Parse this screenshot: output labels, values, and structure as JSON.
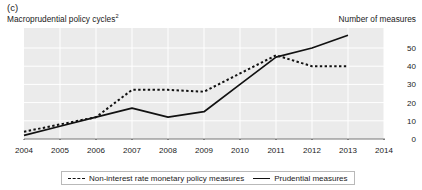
{
  "panel": {
    "letter": "(c)",
    "title": "Macroprudential policy cycles",
    "title_footnote": "2",
    "unit_label": "Number of measures"
  },
  "legend": {
    "position": "bottom-center",
    "items": [
      {
        "label": "Non-interest rate monetary policy measures",
        "style": "dashed",
        "color": "#111111"
      },
      {
        "label": "Prudential measures",
        "style": "solid",
        "color": "#111111"
      }
    ]
  },
  "axes": {
    "y_side": "right",
    "y_ticks": [
      "0",
      "10",
      "20",
      "30",
      "40",
      "50"
    ],
    "x_ticks": [
      "2004",
      "2005",
      "2006",
      "2007",
      "2008",
      "2009",
      "2010",
      "2011",
      "2012",
      "2013",
      "2014"
    ],
    "grid": true,
    "plot_background": "#ebebeb",
    "grid_color": "#ffffff"
  },
  "chart_data": {
    "type": "line",
    "title": "Macroprudential policy cycles",
    "xlabel": "",
    "ylabel": "Number of measures",
    "xlim": [
      2004,
      2014
    ],
    "ylim": [
      0,
      57
    ],
    "grid": true,
    "legend_position": "bottom-center",
    "x": [
      2004,
      2005,
      2006,
      2007,
      2008,
      2009,
      2010,
      2011,
      2012,
      2013
    ],
    "series": [
      {
        "name": "Non-interest rate monetary policy measures",
        "style": "dashed",
        "color": "#111111",
        "values": [
          4,
          8,
          12,
          27,
          27,
          26,
          36,
          46,
          40,
          40
        ]
      },
      {
        "name": "Prudential measures",
        "style": "solid",
        "color": "#111111",
        "values": [
          2,
          7,
          12,
          17,
          12,
          15,
          30,
          45,
          50,
          57
        ]
      }
    ]
  }
}
